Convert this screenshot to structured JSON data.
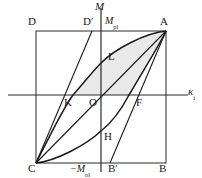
{
  "figure": {
    "type": "moment-curvature-hysteresis-diagram",
    "background_color": "#ffffff",
    "line_color": "#1a1a1a",
    "shade_color": "#e9e9e9",
    "axes": {
      "vertical_label": "M",
      "horizontal_label": "κ",
      "horizontal_label_sub": "i",
      "origin_label": "O"
    },
    "value_labels": {
      "m_pl_positive": "M",
      "m_pl_positive_sub": "pl",
      "m_pl_negative": "−M",
      "m_pl_negative_sub": "pl"
    },
    "points": [
      {
        "name": "D",
        "label": "D",
        "prime": false,
        "x": 28,
        "y": 22
      },
      {
        "name": "Dp",
        "label": "D",
        "prime": true,
        "x": 83,
        "y": 22
      },
      {
        "name": "A",
        "label": "A",
        "prime": false,
        "x": 160,
        "y": 22
      },
      {
        "name": "L",
        "label": "L",
        "prime": false,
        "x": 108,
        "y": 56
      },
      {
        "name": "K",
        "label": "K",
        "prime": false,
        "x": 64,
        "y": 99
      },
      {
        "name": "F",
        "label": "F",
        "prime": false,
        "x": 142,
        "y": 99
      },
      {
        "name": "H",
        "label": "H",
        "prime": false,
        "x": 104,
        "y": 136
      },
      {
        "name": "C",
        "label": "C",
        "prime": false,
        "x": 28,
        "y": 164
      },
      {
        "name": "Bp",
        "label": "B",
        "prime": true,
        "x": 118,
        "y": 164
      },
      {
        "name": "B",
        "label": "B",
        "prime": false,
        "x": 159,
        "y": 164
      }
    ],
    "geometry": {
      "rect": {
        "left": 36,
        "top": 31,
        "right": 166,
        "bottom": 163
      },
      "axis_h": {
        "x1": 8,
        "y": 95,
        "x2": 188
      },
      "axis_v": {
        "x": 101,
        "y1": 8,
        "y2": 172
      },
      "point_A": {
        "x": 166,
        "y": 31
      },
      "point_C": {
        "x": 36,
        "y": 163
      },
      "point_K": {
        "x": 73,
        "y": 95
      },
      "point_F": {
        "x": 129,
        "y": 95
      },
      "point_L": {
        "x": 101,
        "y": 63
      },
      "point_H": {
        "x": 101,
        "y": 131
      },
      "point_Dp": {
        "x": 92,
        "y": 31
      },
      "point_Bp": {
        "x": 110,
        "y": 163
      },
      "upper_curve": "C..L..A",
      "lower_curve": "A..H..C",
      "chord_CA": "C-A",
      "chord_DpK": "D'-K-C",
      "chord_BpF": "B'-F-A",
      "shaded_region": "K-L-A-F-K"
    }
  }
}
